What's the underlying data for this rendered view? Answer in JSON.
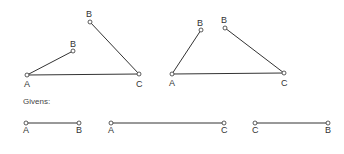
{
  "givens_label": "Givens:",
  "colors": {
    "stroke": "#333333",
    "label": "#333333"
  },
  "figures": [
    {
      "name": "left-construction",
      "points": [
        {
          "label": "A",
          "x": 27,
          "y": 75,
          "lx": 24,
          "ly": 87
        },
        {
          "label": "C",
          "x": 139,
          "y": 74,
          "lx": 136,
          "ly": 87
        },
        {
          "label": "B",
          "x": 73,
          "y": 51,
          "lx": 70,
          "ly": 47
        },
        {
          "label": "B",
          "x": 90,
          "y": 22,
          "lx": 86,
          "ly": 17
        }
      ],
      "segments": [
        [
          0,
          1
        ],
        [
          0,
          2
        ],
        [
          3,
          1
        ]
      ]
    },
    {
      "name": "right-construction",
      "points": [
        {
          "label": "A",
          "x": 172,
          "y": 74,
          "lx": 169,
          "ly": 86
        },
        {
          "label": "C",
          "x": 284,
          "y": 73,
          "lx": 281,
          "ly": 86
        },
        {
          "label": "B",
          "x": 201,
          "y": 30,
          "lx": 197,
          "ly": 26
        },
        {
          "label": "B",
          "x": 225,
          "y": 28,
          "lx": 221,
          "ly": 23
        }
      ],
      "segments": [
        [
          0,
          1
        ],
        [
          0,
          2
        ],
        [
          3,
          1
        ]
      ]
    }
  ],
  "givens": [
    {
      "name": "segment-AB",
      "x1": 26,
      "x2": 79,
      "y": 123,
      "left": "A",
      "right": "B"
    },
    {
      "name": "segment-AC",
      "x1": 111,
      "x2": 224,
      "y": 123,
      "left": "A",
      "right": "C"
    },
    {
      "name": "segment-CB",
      "x1": 255,
      "x2": 328,
      "y": 123,
      "left": "C",
      "right": "B"
    }
  ]
}
